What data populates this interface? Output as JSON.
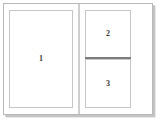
{
  "window": {
    "title": "Layout Pane Diagram",
    "background_color": "#ffffff",
    "border_color": "#b9b9b9",
    "shadow_color": "#969696"
  },
  "layout": {
    "orientation": "horizontal-split",
    "divider_color": "#9d9d9d",
    "pane_border_color": "#c6c6c6",
    "label_color": "#3a3a3a"
  },
  "panes": [
    {
      "id": "pane-1",
      "label": "1",
      "region": "left",
      "position": "full"
    },
    {
      "id": "pane-2",
      "label": "2",
      "region": "right",
      "position": "top"
    },
    {
      "id": "pane-3",
      "label": "3",
      "region": "right",
      "position": "bottom"
    }
  ],
  "dividers": {
    "vertical_label": "vertical-splitter",
    "horizontal_label": "horizontal-splitter"
  }
}
